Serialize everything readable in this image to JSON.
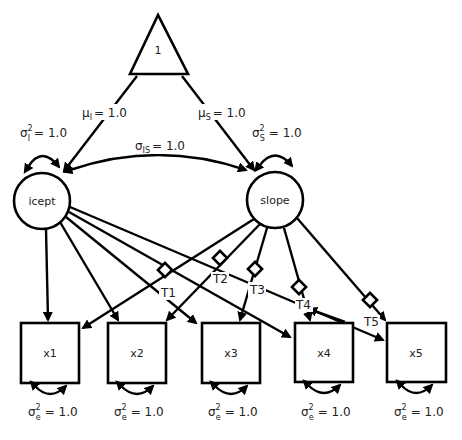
{
  "diagram": {
    "type": "latent growth curve path diagram",
    "constant": {
      "label": "1"
    },
    "latents": [
      {
        "id": "icept",
        "label": "icept",
        "variance": {
          "symbol": "σ",
          "sup": "2",
          "sub": "I",
          "value": "= 1.0"
        },
        "mean": {
          "symbol": "μ",
          "sub": "I",
          "value": "= 1.0"
        }
      },
      {
        "id": "slope",
        "label": "slope",
        "variance": {
          "symbol": "σ",
          "sup": "2",
          "sub": "S",
          "value": "= 1.0"
        },
        "mean": {
          "symbol": "μ",
          "sub": "S",
          "value": "= 1.0"
        }
      }
    ],
    "covariance": {
      "symbol": "σ",
      "sub": "IS",
      "value": "= 1.0"
    },
    "observed": [
      {
        "id": "x1",
        "label": "x1",
        "residual": {
          "symbol": "σ",
          "sup": "2",
          "sub": "e",
          "value": "= 1.0"
        }
      },
      {
        "id": "x2",
        "label": "x2",
        "residual": {
          "symbol": "σ",
          "sup": "2",
          "sub": "e",
          "value": "= 1.0"
        }
      },
      {
        "id": "x3",
        "label": "x3",
        "residual": {
          "symbol": "σ",
          "sup": "2",
          "sub": "e",
          "value": "= 1.0"
        }
      },
      {
        "id": "x4",
        "label": "x4",
        "residual": {
          "symbol": "σ",
          "sup": "2",
          "sub": "e",
          "value": "= 1.0"
        }
      },
      {
        "id": "x5",
        "label": "x5",
        "residual": {
          "symbol": "σ",
          "sup": "2",
          "sub": "e",
          "value": "= 1.0"
        }
      }
    ],
    "time_loadings": [
      {
        "label": "T1",
        "target": "x2"
      },
      {
        "label": "T2",
        "target": "x2"
      },
      {
        "label": "T3",
        "target": "x3"
      },
      {
        "label": "T4",
        "target": "x4"
      },
      {
        "label": "T5",
        "target": "x5"
      }
    ]
  }
}
